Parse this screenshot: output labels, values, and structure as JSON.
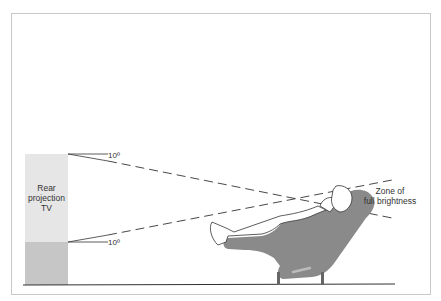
{
  "diagram": {
    "tv_label_lines": [
      "Rear",
      "projection",
      "TV"
    ],
    "angle_top_label": "10º",
    "angle_bottom_label": "10º",
    "zone_label_lines": [
      "Zone of",
      "full brightness"
    ],
    "colors": {
      "tv_upper": "#e6e6e6",
      "tv_lower": "#c6c6c6",
      "chair": "#8a8a8a",
      "line": "#333333",
      "frame": "#c8c8c8"
    }
  }
}
